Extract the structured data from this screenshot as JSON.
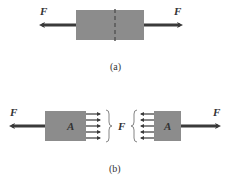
{
  "figure_a": {
    "caption": "(a)",
    "left_force_label": "F",
    "right_force_label": "F",
    "bar_color": "#8c8c8c",
    "arrow_color": "#3a3a3a",
    "section_line": "dashed"
  },
  "figure_b": {
    "caption": "(b)",
    "left_force_label": "F",
    "right_force_label": "F",
    "left_block_label": "A",
    "right_block_label": "A",
    "internal_force_label": "F",
    "distributed_arrow_count": 5,
    "bar_color": "#8c8c8c",
    "arrow_color": "#3a3a3a"
  }
}
